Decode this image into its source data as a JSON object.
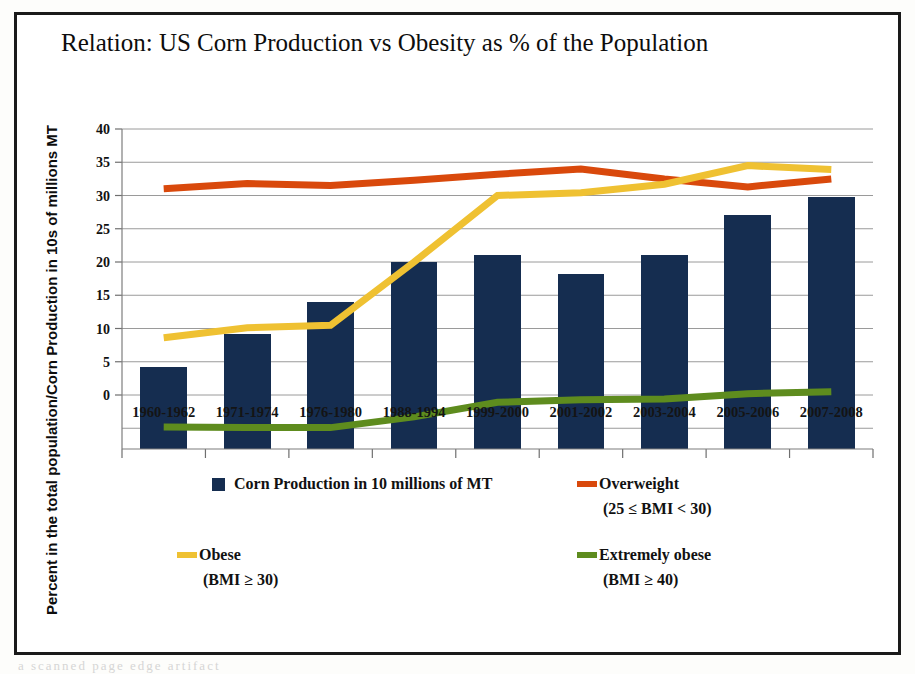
{
  "figure": {
    "title": "Relation: US Corn Production vs Obesity as % of the Population",
    "y_axis_title": "Percent in the total population/Corn Production in 10s of millions MT",
    "bleed_text": "a scanned page edge artifact"
  },
  "colors": {
    "bar_navy": "#152D50",
    "overweight_red": "#D9490C",
    "obese_yellow": "#EFC132",
    "extremely_obese_green": "#5E8C1E",
    "gridline": "#9a9a9a",
    "frame": "#1a1a1a",
    "text": "#111111",
    "plot_background": "#ffffff"
  },
  "legend": {
    "entries": [
      {
        "label": "Corn Production in 10 millions of MT",
        "sublabel": "",
        "marker": "square",
        "color_key": "bar_navy"
      },
      {
        "label": "Overweight",
        "sublabel": "(25 ≤ BMI < 30)",
        "marker": "line",
        "color_key": "overweight_red"
      },
      {
        "label": "Obese",
        "sublabel": "(BMI ≥ 30)",
        "marker": "line",
        "color_key": "obese_yellow"
      },
      {
        "label": "Extremely obese",
        "sublabel": "(BMI ≥ 40)",
        "marker": "line",
        "color_key": "extremely_obese_green"
      }
    ]
  },
  "chart_data": {
    "type": "bar",
    "title": "Relation: US Corn Production vs Obesity as % of the Population",
    "xlabel": "",
    "ylabel": "Percent in the total population/Corn Production in 10s of millions MT",
    "ylim": [
      0,
      40
    ],
    "yticks": [
      0,
      5,
      10,
      15,
      20,
      25,
      30,
      35,
      40
    ],
    "grid": true,
    "legend_position": "bottom",
    "categories": [
      "1960-1962",
      "1971-1974",
      "1976-1980",
      "1988-1994",
      "1999-2000",
      "2001-2002",
      "2003-2004",
      "2005-2006",
      "2007-2008"
    ],
    "series": [
      {
        "name": "Corn Production in 10 millions of MT",
        "type": "bar",
        "color_key": "bar_navy",
        "values": [
          4.2,
          9.2,
          14.0,
          20.0,
          21.0,
          18.2,
          21.0,
          27.0,
          29.8
        ]
      },
      {
        "name": "Overweight (25 ≤ BMI < 30)",
        "type": "line",
        "color_key": "overweight_red",
        "values": [
          31.0,
          31.8,
          31.5,
          32.3,
          33.2,
          34.0,
          32.5,
          31.3,
          32.5
        ]
      },
      {
        "name": "Obese (BMI ≥ 30)",
        "type": "line",
        "color_key": "obese_yellow",
        "values": [
          8.6,
          10.1,
          10.5,
          20.0,
          30.0,
          30.4,
          31.7,
          34.5,
          33.9
        ]
      },
      {
        "name": "Extremely obese (BMI ≥ 40)",
        "type": "line",
        "color_key": "extremely_obese_green",
        "values": [
          -4.8,
          -4.9,
          -4.9,
          -3.3,
          -1.1,
          -0.7,
          -0.6,
          0.2,
          0.5
        ]
      }
    ]
  }
}
